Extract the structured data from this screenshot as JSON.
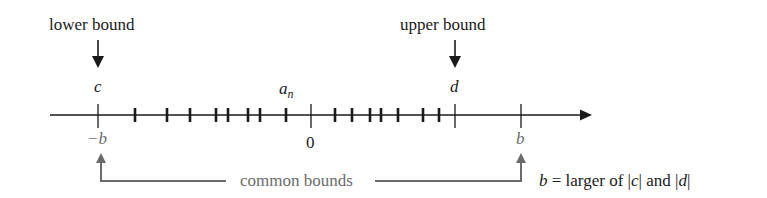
{
  "diagram": {
    "top_labels": {
      "lower_bound": "lower bound",
      "upper_bound": "upper bound"
    },
    "point_labels": {
      "c": "c",
      "d": "d",
      "a_n_base": "a",
      "a_n_sub": "n",
      "neg_b": "−b",
      "zero": "0",
      "b": "b"
    },
    "bracket_caption": "common bounds",
    "definition": {
      "lhs": "b",
      "text_1": " = larger of |",
      "c": "c",
      "text_2": "| and |",
      "d": "d",
      "text_3": "|"
    },
    "axis": {
      "x_start": 50,
      "x_end": 590,
      "y": 115,
      "major_ticks": [
        {
          "name": "neg-b",
          "x": 98
        },
        {
          "name": "zero",
          "x": 311
        },
        {
          "name": "d",
          "x": 455
        },
        {
          "name": "b",
          "x": 521
        }
      ],
      "sequence_ticks_x": [
        135,
        167,
        190,
        216,
        228,
        248,
        260,
        286,
        335,
        352,
        370,
        381,
        398,
        423,
        439
      ]
    },
    "colors": {
      "ink": "#1a1a1a",
      "grey": "#6b6b6b"
    }
  }
}
